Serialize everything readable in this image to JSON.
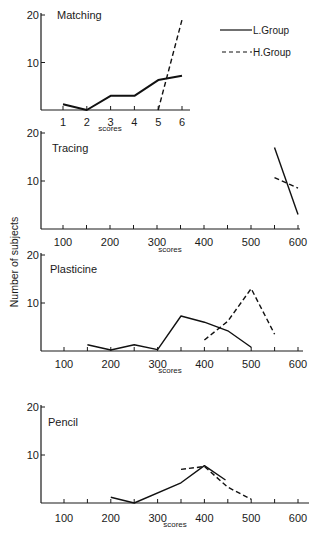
{
  "figure": {
    "ylabel": "Number of subjects",
    "legend": [
      {
        "name": "L.Group",
        "style": "solid"
      },
      {
        "name": "H.Group",
        "style": "dashed"
      }
    ]
  },
  "chart_data": [
    {
      "type": "line",
      "title": "Matching",
      "xlabel": "scores",
      "ylabel": "Number of subjects",
      "x_ticks": [
        1,
        2,
        3,
        4,
        5,
        6
      ],
      "y_ticks": [
        10,
        20
      ],
      "xlim": [
        0.1,
        6.3
      ],
      "ylim": [
        0,
        20
      ],
      "series": [
        {
          "name": "L.Group",
          "style": "solid",
          "x": [
            1,
            2,
            3,
            4,
            5,
            6
          ],
          "y": [
            1.2,
            0,
            3,
            3,
            6.3,
            7.2
          ]
        },
        {
          "name": "H.Group",
          "style": "dashed",
          "x": [
            5,
            6
          ],
          "y": [
            0,
            19
          ]
        }
      ]
    },
    {
      "type": "line",
      "title": "Tracing",
      "xlabel": "scores",
      "ylabel": "Number of subjects",
      "x_ticks": [
        100,
        150,
        200,
        250,
        300,
        350,
        400,
        450,
        500,
        550,
        600
      ],
      "x_tick_labels": [
        100,
        200,
        300,
        400,
        500,
        600
      ],
      "y_ticks": [
        10,
        20
      ],
      "xlim": [
        50,
        610
      ],
      "ylim": [
        0,
        20
      ],
      "series": [
        {
          "name": "L.Group",
          "style": "solid",
          "x": [
            550,
            600
          ],
          "y": [
            17,
            3
          ]
        },
        {
          "name": "H.Group",
          "style": "dashed",
          "x": [
            550,
            600
          ],
          "y": [
            10.7,
            8.5
          ]
        }
      ]
    },
    {
      "type": "line",
      "title": "Plasticine",
      "xlabel": "scores",
      "ylabel": "Number of subjects",
      "x_ticks": [
        100,
        150,
        200,
        250,
        300,
        350,
        400,
        450,
        500,
        550,
        600
      ],
      "x_tick_labels": [
        100,
        200,
        300,
        400,
        500,
        600
      ],
      "y_ticks": [
        10,
        20
      ],
      "xlim": [
        50,
        610
      ],
      "ylim": [
        0,
        20
      ],
      "series": [
        {
          "name": "L.Group",
          "style": "solid",
          "x": [
            150,
            200,
            250,
            300,
            350,
            400,
            450,
            500
          ],
          "y": [
            1.3,
            0.2,
            1.3,
            0.3,
            7.3,
            6,
            4.2,
            0.8
          ]
        },
        {
          "name": "H.Group",
          "style": "dashed",
          "x": [
            400,
            450,
            500,
            550
          ],
          "y": [
            2.3,
            6.2,
            13,
            3.5
          ]
        }
      ]
    },
    {
      "type": "line",
      "title": "Pencil",
      "xlabel": "scores",
      "ylabel": "Number of subjects",
      "x_ticks": [
        100,
        150,
        200,
        250,
        300,
        350,
        400,
        450,
        500,
        550,
        600
      ],
      "x_tick_labels": [
        100,
        200,
        300,
        400,
        500,
        600
      ],
      "y_ticks": [
        10,
        20
      ],
      "xlim": [
        50,
        610
      ],
      "ylim": [
        0,
        20
      ],
      "series": [
        {
          "name": "L.Group",
          "style": "solid",
          "x": [
            200,
            250,
            350,
            400,
            445
          ],
          "y": [
            1.2,
            0,
            4.2,
            7.8,
            4.8
          ]
        },
        {
          "name": "H.Group",
          "style": "dashed",
          "x": [
            350,
            400,
            450,
            500
          ],
          "y": [
            7,
            7.6,
            3.3,
            0.8
          ]
        }
      ]
    }
  ]
}
